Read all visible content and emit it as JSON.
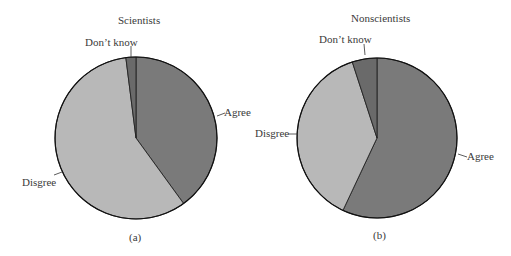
{
  "chart_data": [
    {
      "type": "pie",
      "panel_label": "(a)",
      "title": "Scientists",
      "categories": [
        "Agree",
        "Disgree",
        "Don't know"
      ],
      "values": [
        40,
        58,
        2
      ],
      "unit": "percent (estimated)",
      "colors": [
        "#7a7a7a",
        "#b8b8b8",
        "#6a6a6a"
      ],
      "legend": "none (direct labels with leader lines)"
    },
    {
      "type": "pie",
      "panel_label": "(b)",
      "title": "Nonscientists",
      "categories": [
        "Agree",
        "Disgree",
        "Don't know"
      ],
      "values": [
        57,
        38,
        5
      ],
      "unit": "percent (estimated)",
      "colors": [
        "#7a7a7a",
        "#b8b8b8",
        "#6a6a6a"
      ],
      "legend": "none (direct labels with leader lines)"
    }
  ],
  "panels": {
    "a": {
      "title": "Scientists",
      "caption": "(a)",
      "labels": {
        "agree": "Agree",
        "disagree": "Disgree",
        "dontknow": "Don’t know"
      }
    },
    "b": {
      "title": "Nonscientists",
      "caption": "(b)",
      "labels": {
        "agree": "Agree",
        "disagree": "Disgree",
        "dontknow": "Don’t know"
      }
    }
  }
}
